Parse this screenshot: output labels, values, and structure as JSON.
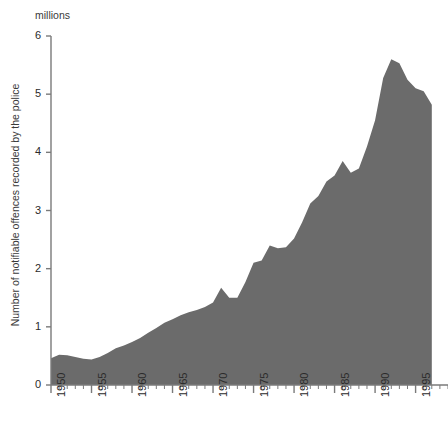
{
  "chart_data": {
    "type": "area",
    "title": "",
    "subtitle": "",
    "units_label": "millions",
    "ylabel": "Number of notifiable offences recorded by the police",
    "xlabel": "",
    "ylim": [
      0,
      6
    ],
    "xlim": [
      1950,
      1999
    ],
    "y_ticks": [
      0,
      1,
      2,
      3,
      4,
      5,
      6
    ],
    "y_tick_labels": [
      "0",
      "1",
      "2",
      "3",
      "4",
      "5",
      "6"
    ],
    "x_ticks": [
      1950,
      1955,
      1960,
      1965,
      1970,
      1975,
      1980,
      1985,
      1990,
      1995
    ],
    "x_tick_labels": [
      "1950",
      "1955",
      "1960",
      "1965",
      "1970",
      "1975",
      "1980",
      "1985",
      "1990",
      "1995"
    ],
    "x_minor_tick_interval": 1,
    "grid": false,
    "legend": null,
    "legend_position": "none",
    "fill_color": "#6b6b6b",
    "axis_color": "#7a7a7a",
    "x": [
      1950,
      1951,
      1952,
      1953,
      1954,
      1955,
      1956,
      1957,
      1958,
      1959,
      1960,
      1961,
      1962,
      1963,
      1964,
      1965,
      1966,
      1967,
      1968,
      1969,
      1970,
      1971,
      1972,
      1973,
      1974,
      1975,
      1976,
      1977,
      1978,
      1979,
      1980,
      1981,
      1982,
      1983,
      1984,
      1985,
      1986,
      1987,
      1988,
      1989,
      1990,
      1991,
      1992,
      1993,
      1994,
      1995,
      1996,
      1997
    ],
    "values": [
      0.46,
      0.52,
      0.51,
      0.48,
      0.45,
      0.44,
      0.48,
      0.55,
      0.63,
      0.68,
      0.74,
      0.81,
      0.9,
      0.98,
      1.07,
      1.13,
      1.2,
      1.25,
      1.29,
      1.34,
      1.42,
      1.67,
      1.5,
      1.5,
      1.77,
      2.1,
      2.14,
      2.4,
      2.35,
      2.37,
      2.52,
      2.8,
      3.12,
      3.25,
      3.5,
      3.6,
      3.85,
      3.65,
      3.72,
      4.1,
      4.55,
      5.28,
      5.6,
      5.53,
      5.25,
      5.1,
      5.05,
      4.82
    ],
    "data_end_year": 1997,
    "peak": {
      "year": 1992,
      "value": 5.6
    },
    "axis_end_year": 1999
  }
}
